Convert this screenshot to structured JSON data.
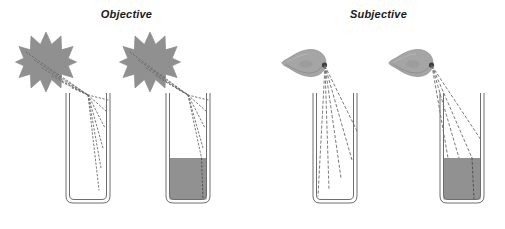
{
  "figure": {
    "width": 505,
    "height": 229,
    "background": "#ffffff"
  },
  "panels": [
    {
      "id": "objective",
      "title": "Objective",
      "title_style": "bold-italic",
      "source_type": "starburst-light-source",
      "ray_style": "dotted",
      "scenes": [
        {
          "id": "objective-empty",
          "beaker_fill": "empty",
          "fill_level_pct": 0
        },
        {
          "id": "objective-filled",
          "beaker_fill": "liquid",
          "fill_level_pct": 55
        }
      ]
    },
    {
      "id": "subjective",
      "title": "Subjective",
      "title_style": "bold-italic",
      "source_type": "eye-observer",
      "ray_style": "dashed",
      "scenes": [
        {
          "id": "subjective-empty",
          "beaker_fill": "empty",
          "fill_level_pct": 0
        },
        {
          "id": "subjective-filled",
          "beaker_fill": "liquid",
          "fill_level_pct": 55
        }
      ]
    }
  ],
  "colors": {
    "background": "#ffffff",
    "star_fill": "#909090",
    "star_stroke": "#8a8a8a",
    "eye_fill": "#a5a5a5",
    "eye_shade": "#8f8f8f",
    "eye_pupil": "#3d3d3d",
    "beaker_stroke": "#6e6e6e",
    "liquid_fill": "#919191",
    "ray_color": "#6b6b6b",
    "title_color": "#1a1a1a"
  },
  "geometry": {
    "beakers": [
      {
        "id": "beaker-1",
        "x": 66,
        "y": 93,
        "width": 44,
        "height": 110
      },
      {
        "id": "beaker-2",
        "x": 166,
        "y": 93,
        "width": 44,
        "height": 110
      },
      {
        "id": "beaker-3",
        "x": 313,
        "y": 93,
        "width": 44,
        "height": 110
      },
      {
        "id": "beaker-4",
        "x": 440,
        "y": 93,
        "width": 44,
        "height": 110
      }
    ],
    "stars": [
      {
        "id": "star-1",
        "cx": 46,
        "cy": 62,
        "r": 28
      },
      {
        "id": "star-2",
        "cx": 150,
        "cy": 62,
        "r": 28
      }
    ],
    "eyes": [
      {
        "id": "eye-1",
        "cx": 312,
        "cy": 63,
        "rx": 15,
        "ry": 13
      },
      {
        "id": "eye-2",
        "cx": 419,
        "cy": 63,
        "rx": 15,
        "ry": 13
      }
    ],
    "liquid_surface_y": 158
  }
}
